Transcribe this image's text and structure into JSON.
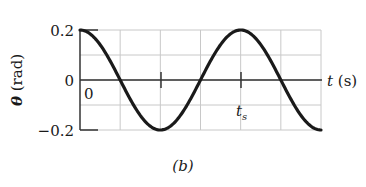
{
  "chart_data": {
    "type": "line",
    "title": "",
    "caption": "(b)",
    "xlabel": "t (s)",
    "ylabel": "θ (rad)",
    "ylim": [
      -0.2,
      0.2
    ],
    "yticks": [
      {
        "value": 0.2,
        "label": "0.2"
      },
      {
        "value": 0,
        "label": "0"
      },
      {
        "value": -0.2,
        "label": "-0.2"
      }
    ],
    "x_origin_label": "0",
    "x_marker_label": "t_s",
    "x_marker_position_periods": 1,
    "grid": true,
    "grid_columns": 6,
    "grid_rows": 4,
    "series": [
      {
        "name": "θ(t)",
        "function": "0.2*cos(2π t / t_s)",
        "amplitude": 0.2,
        "periods_shown": 1.5,
        "x_periods": [
          0,
          0.25,
          0.5,
          0.75,
          1.0,
          1.25,
          1.5
        ],
        "values": [
          0.2,
          0,
          -0.2,
          0,
          0.2,
          0,
          -0.2
        ]
      }
    ],
    "colors": {
      "curve": "#1a1a1a",
      "grid": "#c8c8c8",
      "axis": "#333333"
    }
  }
}
